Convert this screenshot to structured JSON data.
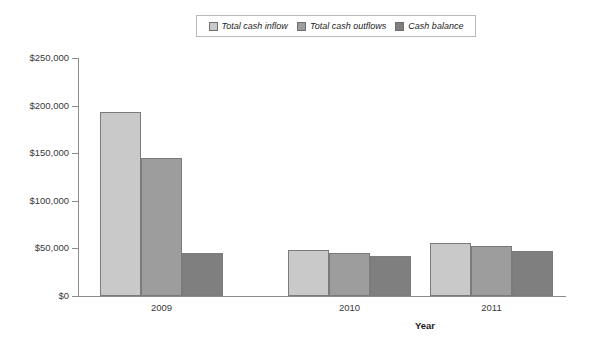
{
  "chart_data": {
    "type": "bar",
    "title": "",
    "xlabel": "Year",
    "ylabel": "",
    "categories": [
      "2009",
      "2010",
      "2011"
    ],
    "series": [
      {
        "name": "Total cash inflow",
        "color": "#c9c9c9",
        "values": [
          193000,
          48000,
          55500
        ]
      },
      {
        "name": "Total cash outflows",
        "color": "#9d9d9d",
        "values": [
          145000,
          45500,
          53000
        ]
      },
      {
        "name": "Cash balance",
        "color": "#7f7f7f",
        "values": [
          45000,
          42000,
          47500
        ]
      }
    ],
    "ylim": [
      0,
      250000
    ],
    "ytick_values": [
      0,
      50000,
      100000,
      150000,
      200000,
      250000
    ],
    "ytick_labels": [
      "$0",
      "$50,000",
      "$100,000",
      "$150,000",
      "$200,000",
      "$250,000"
    ],
    "grid": false,
    "legend_position": "top",
    "legend_border": true
  },
  "legend": {
    "items": [
      {
        "label": "Total cash inflow",
        "swatch_color": "#c9c9c9",
        "swatch_name": "legend-swatch-inflow"
      },
      {
        "label": "Total cash outflows",
        "swatch_color": "#9d9d9d",
        "swatch_name": "legend-swatch-outflow"
      },
      {
        "label": "Cash balance",
        "swatch_color": "#7f7f7f",
        "swatch_name": "legend-swatch-balance"
      }
    ]
  },
  "axes": {
    "y_labels": [
      "$250,000",
      "$200,000",
      "$150,000",
      "$100,000",
      "$50,000",
      "$0"
    ],
    "x_labels": [
      "2009",
      "2010",
      "2011"
    ],
    "x_title": "Year"
  },
  "colors": {
    "axis": "#8d8d8d",
    "bar_border": "#7b7b7b",
    "text": "#3a3a3a",
    "legend_border": "#b9b9b9",
    "background": "#ffffff"
  }
}
